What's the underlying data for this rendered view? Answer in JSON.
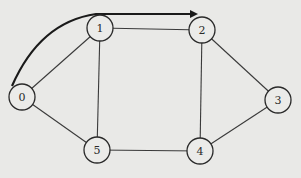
{
  "diagram": {
    "type": "undirected-graph-with-path",
    "nodes": [
      {
        "id": "0",
        "label": "0",
        "x": 22,
        "y": 97
      },
      {
        "id": "1",
        "label": "1",
        "x": 100,
        "y": 28
      },
      {
        "id": "2",
        "label": "2",
        "x": 202,
        "y": 30
      },
      {
        "id": "3",
        "label": "3",
        "x": 278,
        "y": 100
      },
      {
        "id": "4",
        "label": "4",
        "x": 200,
        "y": 151
      },
      {
        "id": "5",
        "label": "5",
        "x": 97,
        "y": 150
      }
    ],
    "edges": [
      {
        "from": "0",
        "to": "1"
      },
      {
        "from": "0",
        "to": "5"
      },
      {
        "from": "1",
        "to": "2"
      },
      {
        "from": "1",
        "to": "5"
      },
      {
        "from": "2",
        "to": "3"
      },
      {
        "from": "2",
        "to": "4"
      },
      {
        "from": "3",
        "to": "4"
      },
      {
        "from": "5",
        "to": "4"
      }
    ],
    "highlighted_path": {
      "description": "bold curved arrow from node 0 over node 1 to node 2",
      "sequence": [
        "0",
        "1",
        "2"
      ],
      "color": "#1a1a1a"
    }
  }
}
